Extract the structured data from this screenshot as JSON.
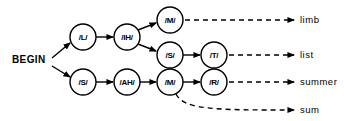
{
  "diagram": {
    "colors": {
      "background": "#ffffff",
      "stroke": "#000000",
      "node_fill": "#ffffff"
    },
    "start": {
      "label": "BEGIN",
      "x": 12,
      "y": 63
    },
    "nodes": [
      {
        "id": "n-l",
        "label": "/L/",
        "cx": 83,
        "cy": 37,
        "r": 13
      },
      {
        "id": "n-ih",
        "label": "/IH/",
        "cx": 127,
        "cy": 37,
        "r": 13
      },
      {
        "id": "n-m1",
        "label": "/M/",
        "cx": 170,
        "cy": 20,
        "r": 13
      },
      {
        "id": "n-s1",
        "label": "/S/",
        "cx": 170,
        "cy": 55,
        "r": 13
      },
      {
        "id": "n-t",
        "label": "/T/",
        "cx": 214,
        "cy": 55,
        "r": 13
      },
      {
        "id": "n-s2",
        "label": "/S/",
        "cx": 83,
        "cy": 82,
        "r": 13
      },
      {
        "id": "n-ah",
        "label": "/AH/",
        "cx": 127,
        "cy": 82,
        "r": 13
      },
      {
        "id": "n-m2",
        "label": "/M/",
        "cx": 170,
        "cy": 82,
        "r": 13
      },
      {
        "id": "n-r",
        "label": "/R/",
        "cx": 214,
        "cy": 82,
        "r": 13
      }
    ],
    "solid_edges": [
      {
        "id": "edge-begin-l",
        "from": "BEGIN",
        "to": "/L/",
        "d": "M 52 58 L 70 43"
      },
      {
        "id": "edge-begin-s2",
        "from": "BEGIN",
        "to": "/S/",
        "d": "M 52 66 L 70 77"
      },
      {
        "id": "edge-l-ih",
        "from": "/L/",
        "to": "/IH/",
        "d": "M 96 37 L 113 37"
      },
      {
        "id": "edge-ih-m1",
        "from": "/IH/",
        "to": "/M/",
        "d": "M 138 30 L 156 23"
      },
      {
        "id": "edge-ih-s1",
        "from": "/IH/",
        "to": "/S/",
        "d": "M 138 44 L 156 51"
      },
      {
        "id": "edge-s1-t",
        "from": "/S/",
        "to": "/T/",
        "d": "M 183 55 L 200 55"
      },
      {
        "id": "edge-s2-ah",
        "from": "/S/",
        "to": "/AH/",
        "d": "M 96 82 L 113 82"
      },
      {
        "id": "edge-ah-m2",
        "from": "/AH/",
        "to": "/M/",
        "d": "M 140 82 L 156 82"
      },
      {
        "id": "edge-m2-r",
        "from": "/M/",
        "to": "/R/",
        "d": "M 183 82 L 200 82"
      }
    ],
    "dashed_edges": [
      {
        "id": "dashed-m1-limb",
        "from": "/M/",
        "to": "limb",
        "d": "M 185 20 L 294 20"
      },
      {
        "id": "dashed-t-list",
        "from": "/T/",
        "to": "list",
        "d": "M 229 55 L 294 55"
      },
      {
        "id": "dashed-r-summer",
        "from": "/R/",
        "to": "summer",
        "d": "M 229 82 L 294 82"
      },
      {
        "id": "dashed-m2-sum",
        "from": "/M/",
        "to": "sum",
        "d": "M 176 94 C 184 110 215 110 294 110"
      }
    ],
    "outputs": [
      {
        "id": "out-limb",
        "label": "limb",
        "x": 300,
        "y": 23
      },
      {
        "id": "out-list",
        "label": "list",
        "x": 300,
        "y": 58
      },
      {
        "id": "out-summer",
        "label": "summer",
        "x": 300,
        "y": 85
      },
      {
        "id": "out-sum",
        "label": "sum",
        "x": 300,
        "y": 113
      }
    ]
  }
}
